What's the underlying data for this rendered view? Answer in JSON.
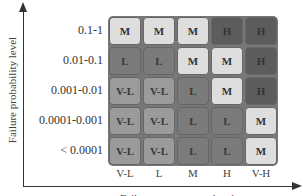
{
  "y_axis": {
    "label": "Failure probability level"
  },
  "x_axis": {
    "label": "Failure consequence level"
  },
  "rows": [
    {
      "label": "0.1-1",
      "cells": [
        "M",
        "M",
        "M",
        "H",
        "H"
      ]
    },
    {
      "label": "0.01-0.1",
      "cells": [
        "L",
        "L",
        "M",
        "M",
        "H"
      ]
    },
    {
      "label": "0.001-0.01",
      "cells": [
        "V-L",
        "V-L",
        "L",
        "M",
        "H"
      ]
    },
    {
      "label": "0.0001-0.001",
      "cells": [
        "V-L",
        "V-L",
        "L",
        "L",
        "M"
      ]
    },
    {
      "label": "< 0.0001",
      "cells": [
        "V-L",
        "V-L",
        "L",
        "L",
        "M"
      ]
    }
  ],
  "columns": [
    "V-L",
    "L",
    "M",
    "H",
    "V-H"
  ],
  "legend_colors": {
    "V-L": "#9b9b9b",
    "L": "#7b7b7b",
    "M": "#dedede",
    "H": "#5c5c5c"
  }
}
